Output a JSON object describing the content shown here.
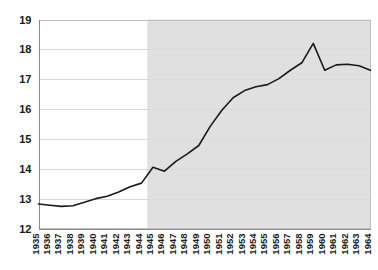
{
  "chart_data": {
    "type": "line",
    "title": "",
    "subtitle": "",
    "xlabel": "",
    "ylabel": "",
    "x": [
      1935,
      1936,
      1937,
      1938,
      1939,
      1940,
      1941,
      1942,
      1943,
      1944,
      1945,
      1946,
      1947,
      1948,
      1949,
      1950,
      1951,
      1952,
      1953,
      1954,
      1955,
      1956,
      1957,
      1958,
      1959,
      1960,
      1961,
      1962,
      1963,
      1964
    ],
    "xtick_labels": [
      "1935",
      "1936",
      "1937",
      "1938",
      "1939",
      "1940",
      "1941",
      "1942",
      "1943",
      "1944",
      "1945",
      "1946",
      "1947",
      "1948",
      "1949",
      "1950",
      "1951",
      "1952",
      "1953",
      "1954",
      "1955",
      "1956",
      "1957",
      "1958",
      "1959",
      "1960",
      "1961",
      "1962",
      "1963",
      "1964"
    ],
    "values": [
      12.82,
      12.78,
      12.74,
      12.76,
      12.88,
      13.0,
      13.08,
      13.22,
      13.4,
      13.52,
      14.05,
      13.92,
      14.25,
      14.5,
      14.78,
      15.42,
      15.95,
      16.38,
      16.62,
      16.75,
      16.82,
      17.02,
      17.3,
      17.55,
      18.2,
      17.3,
      17.48,
      17.5,
      17.45,
      17.3
    ],
    "series": [
      {
        "name": "series-1",
        "values": [
          12.82,
          12.78,
          12.74,
          12.76,
          12.88,
          13.0,
          13.08,
          13.22,
          13.4,
          13.52,
          14.05,
          13.92,
          14.25,
          14.5,
          14.78,
          15.42,
          15.95,
          16.38,
          16.62,
          16.75,
          16.82,
          17.02,
          17.3,
          17.55,
          18.2,
          17.3,
          17.48,
          17.5,
          17.45,
          17.3
        ]
      }
    ],
    "ylim": [
      12,
      19
    ],
    "ytick_labels": [
      "12",
      "13",
      "14",
      "15",
      "16",
      "17",
      "18",
      "19"
    ],
    "ytick_values": [
      12,
      13,
      14,
      15,
      16,
      17,
      18,
      19
    ],
    "xlim": [
      1935,
      1964
    ],
    "grid": true,
    "legend": null,
    "legend_position": "none",
    "annotations": [
      {
        "type": "shaded-region",
        "label": "",
        "x_start": 1945,
        "x_end": 1964,
        "color": "#e0e0e0"
      }
    ],
    "colors": {
      "line": "#1a1a1a",
      "grid": "#d9d9d9",
      "shading": "#e0e0e0",
      "background": "#ffffff",
      "axis": "#8c8c8c",
      "text": "#1a1a1a"
    }
  }
}
